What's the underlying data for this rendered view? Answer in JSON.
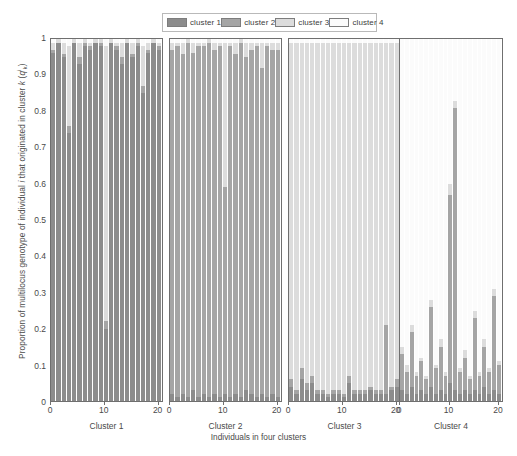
{
  "figure": {
    "xlabel": "Individuals in four clusters",
    "ylabel_parts": {
      "pre": "Proportion of multilocus genotype of individual ",
      "i1": "i",
      "mid": " that originated in cluster ",
      "k1": "k",
      "open": " (",
      "q": "q",
      "sup": "i",
      "sub": "k",
      "close": ")"
    },
    "ylabel_plain": "Proportion of multilocus genotype of individual i that originated in cluster k (q i k )"
  },
  "legend": {
    "position": "top-center",
    "entries": [
      {
        "label": "cluster 1",
        "color": "#8c8c8c",
        "name": "legend-swatch-cluster-1"
      },
      {
        "label": "cluster 2",
        "color": "#a5a5a5",
        "name": "legend-swatch-cluster-2"
      },
      {
        "label": "cluster 3",
        "color": "#dcdcdc",
        "name": "legend-swatch-cluster-3"
      },
      {
        "label": "cluster 4",
        "color": "#fbfbfb",
        "name": "legend-swatch-cluster-4"
      }
    ]
  },
  "axes": {
    "y_ticks": [
      "0",
      "0.1",
      "0.2",
      "0.3",
      "0.4",
      "0.5",
      "0.6",
      "0.7",
      "0.8",
      "0.9",
      "1"
    ],
    "y_values": [
      0,
      0.1,
      0.2,
      0.3,
      0.4,
      0.5,
      0.6,
      0.7,
      0.8,
      0.9,
      1
    ],
    "ylim": [
      0,
      1
    ],
    "x_ticks": [
      "0",
      "10",
      "20"
    ],
    "x_values": [
      0,
      10,
      20
    ],
    "xlim": [
      0,
      21
    ]
  },
  "chart_data": {
    "type": "bar",
    "subtype": "stacked-structure-admixture",
    "title": "",
    "xlabel": "Individuals in four clusters",
    "ylabel": "Proportion of multilocus genotype of individual i that originated in cluster k (q i k)",
    "ylim": [
      0,
      1
    ],
    "grid": false,
    "legend_position": "top-center",
    "series": [
      {
        "name": "cluster 1",
        "color": "#8c8c8c"
      },
      {
        "name": "cluster 2",
        "color": "#a5a5a5"
      },
      {
        "name": "cluster 3",
        "color": "#dcdcdc"
      },
      {
        "name": "cluster 4",
        "color": "#fbfbfb"
      }
    ],
    "panels": [
      {
        "title": "Cluster 1",
        "n_individuals": 21,
        "x_ticks": [
          "0",
          "10",
          "20"
        ],
        "individuals": [
          [
            0.96,
            0.01,
            0.02,
            0.01
          ],
          [
            0.99,
            0.0,
            0.01,
            0.0
          ],
          [
            0.95,
            0.01,
            0.03,
            0.01
          ],
          [
            0.74,
            0.02,
            0.22,
            0.02
          ],
          [
            0.99,
            0.0,
            0.01,
            0.0
          ],
          [
            0.93,
            0.02,
            0.04,
            0.01
          ],
          [
            0.98,
            0.01,
            0.01,
            0.0
          ],
          [
            0.97,
            0.01,
            0.01,
            0.01
          ],
          [
            0.99,
            0.0,
            0.01,
            0.0
          ],
          [
            0.98,
            0.01,
            0.01,
            0.0
          ],
          [
            0.2,
            0.02,
            0.76,
            0.02
          ],
          [
            0.99,
            0.0,
            0.01,
            0.0
          ],
          [
            0.97,
            0.01,
            0.01,
            0.01
          ],
          [
            0.93,
            0.02,
            0.04,
            0.01
          ],
          [
            0.99,
            0.0,
            0.01,
            0.0
          ],
          [
            0.95,
            0.01,
            0.03,
            0.01
          ],
          [
            0.98,
            0.01,
            0.01,
            0.0
          ],
          [
            0.85,
            0.02,
            0.11,
            0.02
          ],
          [
            0.96,
            0.01,
            0.02,
            0.01
          ],
          [
            0.99,
            0.0,
            0.01,
            0.0
          ],
          [
            0.97,
            0.01,
            0.01,
            0.01
          ]
        ]
      },
      {
        "title": "Cluster 2",
        "n_individuals": 21,
        "x_ticks": [
          "0",
          "10",
          "20"
        ],
        "individuals": [
          [
            0.02,
            0.95,
            0.02,
            0.01
          ],
          [
            0.01,
            0.97,
            0.01,
            0.01
          ],
          [
            0.02,
            0.94,
            0.03,
            0.01
          ],
          [
            0.01,
            0.98,
            0.01,
            0.0
          ],
          [
            0.03,
            0.93,
            0.03,
            0.01
          ],
          [
            0.01,
            0.97,
            0.01,
            0.01
          ],
          [
            0.02,
            0.96,
            0.01,
            0.01
          ],
          [
            0.01,
            0.98,
            0.01,
            0.0
          ],
          [
            0.02,
            0.95,
            0.02,
            0.01
          ],
          [
            0.01,
            0.97,
            0.01,
            0.01
          ],
          [
            0.02,
            0.57,
            0.4,
            0.01
          ],
          [
            0.01,
            0.97,
            0.01,
            0.01
          ],
          [
            0.02,
            0.94,
            0.03,
            0.01
          ],
          [
            0.01,
            0.98,
            0.01,
            0.0
          ],
          [
            0.03,
            0.92,
            0.04,
            0.01
          ],
          [
            0.02,
            0.95,
            0.02,
            0.01
          ],
          [
            0.01,
            0.97,
            0.01,
            0.01
          ],
          [
            0.02,
            0.9,
            0.07,
            0.01
          ],
          [
            0.01,
            0.97,
            0.01,
            0.01
          ],
          [
            0.02,
            0.95,
            0.02,
            0.01
          ],
          [
            0.01,
            0.96,
            0.02,
            0.01
          ]
        ]
      },
      {
        "title": "Cluster 3",
        "n_individuals": 21,
        "x_ticks": [
          "0",
          "10",
          "20"
        ],
        "individuals": [
          [
            0.04,
            0.02,
            0.93,
            0.01
          ],
          [
            0.02,
            0.01,
            0.96,
            0.01
          ],
          [
            0.06,
            0.03,
            0.9,
            0.01
          ],
          [
            0.03,
            0.02,
            0.94,
            0.01
          ],
          [
            0.05,
            0.02,
            0.92,
            0.01
          ],
          [
            0.02,
            0.01,
            0.96,
            0.01
          ],
          [
            0.02,
            0.01,
            0.96,
            0.01
          ],
          [
            0.01,
            0.01,
            0.97,
            0.01
          ],
          [
            0.02,
            0.01,
            0.96,
            0.01
          ],
          [
            0.02,
            0.01,
            0.96,
            0.01
          ],
          [
            0.01,
            0.01,
            0.97,
            0.01
          ],
          [
            0.05,
            0.02,
            0.92,
            0.01
          ],
          [
            0.02,
            0.01,
            0.96,
            0.01
          ],
          [
            0.02,
            0.01,
            0.96,
            0.01
          ],
          [
            0.02,
            0.01,
            0.96,
            0.01
          ],
          [
            0.03,
            0.01,
            0.95,
            0.01
          ],
          [
            0.02,
            0.01,
            0.96,
            0.01
          ],
          [
            0.02,
            0.01,
            0.96,
            0.01
          ],
          [
            0.02,
            0.19,
            0.78,
            0.01
          ],
          [
            0.03,
            0.01,
            0.95,
            0.01
          ],
          [
            0.04,
            0.02,
            0.93,
            0.01
          ]
        ]
      },
      {
        "title": "Cluster 4",
        "n_individuals": 21,
        "x_ticks": [
          "0",
          "10",
          "20"
        ],
        "individuals": [
          [
            0.03,
            0.1,
            0.02,
            0.85
          ],
          [
            0.02,
            0.06,
            0.02,
            0.9
          ],
          [
            0.04,
            0.15,
            0.02,
            0.79
          ],
          [
            0.02,
            0.05,
            0.01,
            0.92
          ],
          [
            0.03,
            0.08,
            0.01,
            0.88
          ],
          [
            0.02,
            0.04,
            0.01,
            0.93
          ],
          [
            0.04,
            0.22,
            0.02,
            0.72
          ],
          [
            0.02,
            0.07,
            0.01,
            0.9
          ],
          [
            0.03,
            0.12,
            0.02,
            0.83
          ],
          [
            0.02,
            0.05,
            0.01,
            0.92
          ],
          [
            0.05,
            0.52,
            0.03,
            0.4
          ],
          [
            0.03,
            0.78,
            0.02,
            0.17
          ],
          [
            0.02,
            0.06,
            0.01,
            0.91
          ],
          [
            0.03,
            0.09,
            0.02,
            0.86
          ],
          [
            0.02,
            0.04,
            0.01,
            0.93
          ],
          [
            0.03,
            0.2,
            0.02,
            0.75
          ],
          [
            0.02,
            0.05,
            0.01,
            0.92
          ],
          [
            0.04,
            0.11,
            0.02,
            0.83
          ],
          [
            0.02,
            0.06,
            0.01,
            0.91
          ],
          [
            0.03,
            0.26,
            0.02,
            0.69
          ],
          [
            0.02,
            0.08,
            0.01,
            0.89
          ]
        ]
      }
    ]
  },
  "panel_geometry": [
    {
      "left": 50,
      "width": 113
    },
    {
      "left": 169,
      "width": 113
    },
    {
      "left": 288,
      "width": 113
    },
    {
      "left": 399,
      "width": 104
    }
  ]
}
